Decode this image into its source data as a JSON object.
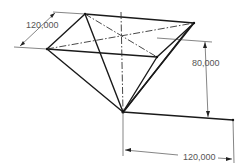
{
  "drawing": {
    "type": "isometric-sketch",
    "shape": "inverted-pyramid",
    "colors": {
      "edge": "#1a1a1a",
      "dimension": "#333333",
      "dimension_text": "#555555",
      "background": "#ffffff"
    }
  },
  "dimensions": {
    "top_width": "120,000",
    "height": "80,000",
    "bottom_width": "120,000"
  }
}
